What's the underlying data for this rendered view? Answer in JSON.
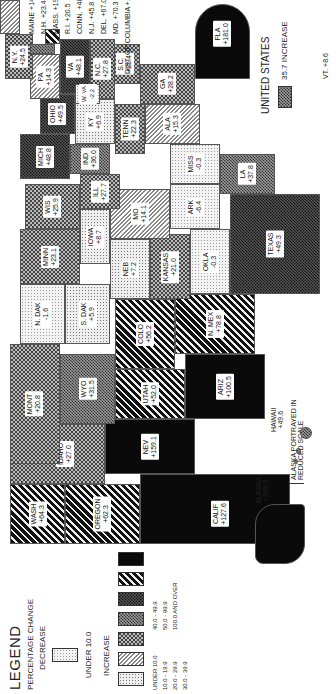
{
  "legend": {
    "title": "LEGEND",
    "subtitle": "PERCENTAGE CHANGE",
    "decrease_heading": "DECREASE",
    "increase_heading": "INCREASE",
    "items": [
      {
        "group": "decrease",
        "label": "UNDER 10.0",
        "pattern": "fine-dots-light"
      },
      {
        "group": "increase",
        "label": "UNDER 10.0",
        "pattern": "dots"
      },
      {
        "group": "increase",
        "label": "10.0 - 19.9",
        "pattern": "fine-diagonal-lines"
      },
      {
        "group": "increase",
        "label": "20.0 - 29.9",
        "pattern": "light-checker"
      },
      {
        "group": "increase",
        "label": "30.0 - 39.9",
        "pattern": "medium-checker"
      },
      {
        "group": "increase",
        "label": "40.0 - 49.9",
        "pattern": "dark-checker"
      },
      {
        "group": "increase",
        "label": "50.0 - 99.9",
        "pattern": "bold-diagonal-stripes"
      },
      {
        "group": "increase",
        "label": "100.0 AND OVER",
        "pattern": "solid-black"
      }
    ]
  },
  "national": {
    "label": "UNITED STATES",
    "value": "35.7 INCREASE"
  },
  "notes": {
    "alaska_scale": "ALASKA PORTRAYED IN REDUCED SCALE"
  },
  "states": {
    "wash": {
      "name": "WASH",
      "value": "+64.3"
    },
    "oregon": {
      "name": "OREGON",
      "value": "+62.3"
    },
    "calif": {
      "name": "CALIF",
      "value": "+127.6"
    },
    "idaho": {
      "name": "IDAHO",
      "value": "+27.0"
    },
    "nev": {
      "name": "NEV",
      "value": "+159.1"
    },
    "mont": {
      "name": "MONT",
      "value": "+20.8"
    },
    "wyo": {
      "name": "WYO",
      "value": "+31.5"
    },
    "utah": {
      "name": "UTAH",
      "value": "+52.0"
    },
    "ariz": {
      "name": "ARIZ",
      "value": "+100.5"
    },
    "colo": {
      "name": "COLO",
      "value": "+56.2"
    },
    "nmex": {
      "name": "N. MEX",
      "value": "+78.8"
    },
    "ndak": {
      "name": "N. DAK",
      "value": "-1.6"
    },
    "sdak": {
      "name": "S. DAK",
      "value": "+5.9"
    },
    "neb": {
      "name": "NEB",
      "value": "+7.2"
    },
    "kansas": {
      "name": "KANSAS",
      "value": "+21.0"
    },
    "okla": {
      "name": "OKLA",
      "value": "-0.3"
    },
    "texas": {
      "name": "TEXAS",
      "value": "+49.3"
    },
    "minn": {
      "name": "MINN",
      "value": "+23.1"
    },
    "iowa": {
      "name": "IOWA",
      "value": "+8.7"
    },
    "mo": {
      "name": "MO",
      "value": "+14.1"
    },
    "ark": {
      "name": "ARK",
      "value": "-6.4"
    },
    "la": {
      "name": "LA",
      "value": "+37.8"
    },
    "wis": {
      "name": "WIS",
      "value": "+25.9"
    },
    "ill": {
      "name": "ILL",
      "value": "+27.7"
    },
    "mich": {
      "name": "MICH",
      "value": "+48.8"
    },
    "ind": {
      "name": "IND",
      "value": "+36.0"
    },
    "ohio": {
      "name": "OHIO",
      "value": "+49.5"
    },
    "ky": {
      "name": "KY",
      "value": "+6.9"
    },
    "tenn": {
      "name": "TENN",
      "value": "+22.3"
    },
    "miss": {
      "name": "MISS",
      "value": "-0.3"
    },
    "ala": {
      "name": "ALA",
      "value": "+15.3"
    },
    "ga": {
      "name": "GA",
      "value": "+28.2"
    },
    "fla": {
      "name": "FLA",
      "value": "+181.0"
    },
    "sc": {
      "name": "S.C.",
      "value": "+25.4"
    },
    "nc": {
      "name": "N.C.",
      "value": "+27.8"
    },
    "va": {
      "name": "VA",
      "value": "+48.1"
    },
    "wva": {
      "name": "W. VA",
      "value": "-2.2"
    },
    "pa": {
      "name": "PA",
      "value": "+14.3"
    },
    "ny": {
      "name": "N.Y.",
      "value": "+24.5"
    },
    "vt": {
      "name": "VT.",
      "value": "+8.6"
    },
    "nh": {
      "name": "N.H.",
      "value": "+23.4"
    },
    "maine": {
      "name": "MAINE",
      "value": "+14.4"
    },
    "mass": {
      "name": "MASS.",
      "value": "+19.3"
    },
    "ri": {
      "name": "R.I.",
      "value": "+20.5"
    },
    "conn": {
      "name": "CONN.",
      "value": "+48.3"
    },
    "nj": {
      "name": "N.J.",
      "value": "+45.8"
    },
    "del": {
      "name": "DEL.",
      "value": "+67.0"
    },
    "md": {
      "name": "MD.",
      "value": "+70.3"
    },
    "dc": {
      "name": "DIST. OF COLUMBIA",
      "value": "+15.2"
    },
    "alaska": {
      "name": "ALASKA",
      "value": "+209.6"
    },
    "hawaii": {
      "name": "HAWAII",
      "value": "+49.6"
    }
  }
}
